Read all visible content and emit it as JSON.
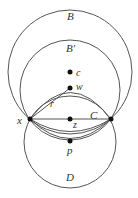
{
  "diagram": {
    "labels": {
      "B": "B",
      "Bp": "B′",
      "c": "c",
      "w": "w",
      "r": "r",
      "x": "x",
      "z": "z",
      "C": "C",
      "p": "p",
      "D": "D"
    },
    "colors": {
      "stroke": "#555555",
      "point": "#111111"
    }
  }
}
